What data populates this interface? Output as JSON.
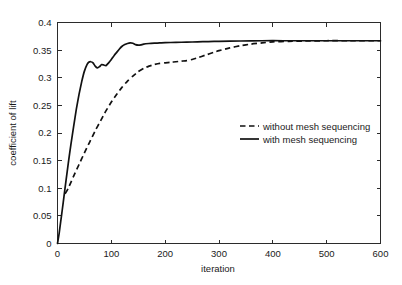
{
  "chart_data": {
    "type": "line",
    "title": "",
    "xlabel": "iteration",
    "ylabel": "coefficient of lift",
    "xlim": [
      0,
      600
    ],
    "ylim": [
      0,
      0.4
    ],
    "xticks": [
      0,
      100,
      200,
      300,
      400,
      500,
      600
    ],
    "xtick_labels": [
      "0",
      "100",
      "200",
      "300",
      "400",
      "500",
      "600"
    ],
    "yticks": [
      0,
      0.05,
      0.1,
      0.15,
      0.2,
      0.25,
      0.3,
      0.35,
      0.4
    ],
    "ytick_labels": [
      "0",
      "0.05",
      "0.1",
      "0.15",
      "0.2",
      "0.25",
      "0.3",
      "0.35",
      "0.4"
    ],
    "grid": false,
    "legend_position": "center-right-inside",
    "legend_frame": false,
    "series": [
      {
        "name": "without mesh sequencing",
        "style": "dashed",
        "color": "#111111",
        "x": [
          14,
          20,
          30,
          40,
          50,
          60,
          70,
          80,
          90,
          100,
          110,
          120,
          130,
          140,
          150,
          160,
          170,
          180,
          190,
          200,
          210,
          220,
          230,
          240,
          250,
          260,
          275,
          290,
          300,
          320,
          340,
          360,
          380,
          400,
          430,
          460,
          500,
          540,
          600
        ],
        "y": [
          0.09,
          0.1,
          0.122,
          0.143,
          0.164,
          0.184,
          0.204,
          0.222,
          0.24,
          0.256,
          0.27,
          0.283,
          0.294,
          0.303,
          0.311,
          0.317,
          0.321,
          0.324,
          0.326,
          0.327,
          0.328,
          0.329,
          0.33,
          0.331,
          0.333,
          0.336,
          0.341,
          0.346,
          0.349,
          0.354,
          0.358,
          0.361,
          0.363,
          0.365,
          0.366,
          0.3665,
          0.367,
          0.367,
          0.367
        ]
      },
      {
        "name": "with mesh sequencing",
        "style": "solid",
        "color": "#111111",
        "x": [
          0,
          3,
          6,
          9,
          12,
          16,
          20,
          25,
          30,
          35,
          40,
          45,
          50,
          55,
          58,
          62,
          66,
          70,
          74,
          78,
          82,
          86,
          90,
          95,
          100,
          105,
          110,
          115,
          120,
          125,
          130,
          135,
          140,
          145,
          150,
          155,
          160,
          170,
          180,
          190,
          200,
          220,
          240,
          260,
          280,
          300,
          340,
          380,
          420,
          460,
          500,
          540,
          600
        ],
        "y": [
          0.0,
          0.018,
          0.04,
          0.062,
          0.085,
          0.115,
          0.145,
          0.18,
          0.212,
          0.243,
          0.27,
          0.293,
          0.312,
          0.324,
          0.328,
          0.329,
          0.327,
          0.321,
          0.318,
          0.32,
          0.324,
          0.323,
          0.322,
          0.327,
          0.333,
          0.34,
          0.346,
          0.352,
          0.357,
          0.36,
          0.362,
          0.363,
          0.3625,
          0.36,
          0.359,
          0.3595,
          0.361,
          0.362,
          0.3625,
          0.363,
          0.3635,
          0.364,
          0.3645,
          0.365,
          0.3655,
          0.366,
          0.3665,
          0.367,
          0.367,
          0.367,
          0.367,
          0.367,
          0.367
        ]
      }
    ]
  },
  "legend": {
    "items": [
      {
        "label": "without mesh sequencing",
        "style": "dashed"
      },
      {
        "label": "with mesh sequencing",
        "style": "solid"
      }
    ]
  }
}
